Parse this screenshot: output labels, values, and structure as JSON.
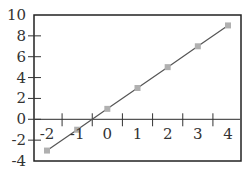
{
  "chart_data": {
    "type": "line",
    "title": "",
    "xlabel": "",
    "ylabel": "",
    "x": [
      -2,
      -1,
      0,
      1,
      2,
      3,
      4
    ],
    "series": [
      {
        "name": "y = 2x + 1",
        "values": [
          -3,
          -1,
          1,
          3,
          5,
          7,
          9
        ],
        "marker": "square",
        "color": "#555555",
        "marker_color": "#b0b0b0"
      }
    ],
    "xlim": [
      -2.5,
      4.4
    ],
    "ylim": [
      -4,
      10
    ],
    "x_tick_labels": [
      "-2",
      "-1",
      "0",
      "1",
      "2",
      "3",
      "4"
    ],
    "y_tick_labels": [
      "10",
      "8",
      "6",
      "4",
      "2",
      "0",
      "-2",
      "-4"
    ],
    "y_ticks": [
      10,
      8,
      6,
      4,
      2,
      0,
      -2,
      -4
    ],
    "x_tick_marks_on_zero_line": [
      -1.5,
      -0.5,
      0.5,
      1.5,
      2.5,
      3.5
    ],
    "grid": false,
    "legend": "none",
    "frame_color": "#222222",
    "zero_line_color": "#555555"
  }
}
